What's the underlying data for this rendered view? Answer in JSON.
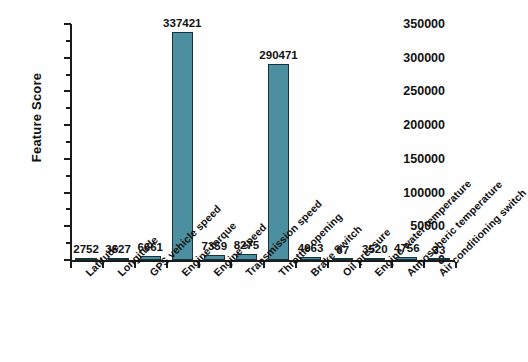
{
  "chart_data": {
    "type": "bar",
    "title": "",
    "xlabel": "",
    "ylabel": "Feature Score",
    "ylim": [
      0,
      350000
    ],
    "ytick_values": [
      0,
      50000,
      100000,
      150000,
      200000,
      250000,
      300000,
      350000
    ],
    "ytick_labels": [
      "0",
      "50000",
      "100000",
      "150000",
      "200000",
      "250000",
      "300000",
      "350000"
    ],
    "grid": false,
    "legend": false,
    "bar_color": "#4b8fa0",
    "bar_edge_color": "#15333b",
    "label_rotation_deg": -45,
    "categories": [
      "Latitude",
      "Longitude",
      "GPS vehicle speed",
      "Engine torque",
      "Engine speed",
      "Transmission speed",
      "Throttle opening",
      "Brake Switch",
      "Oil pressure",
      "Engine water temperature",
      "Atmospheric temperature",
      "Air conditioning switch"
    ],
    "values": [
      2752,
      3627,
      6661,
      337421,
      7359,
      8275,
      290471,
      4963,
      67,
      3520,
      4756,
      33
    ],
    "value_labels": [
      "2752",
      "3627",
      "6661",
      "337421",
      "7359",
      "8275",
      "290471",
      "4963",
      "67",
      "3520",
      "4756",
      "33"
    ]
  }
}
